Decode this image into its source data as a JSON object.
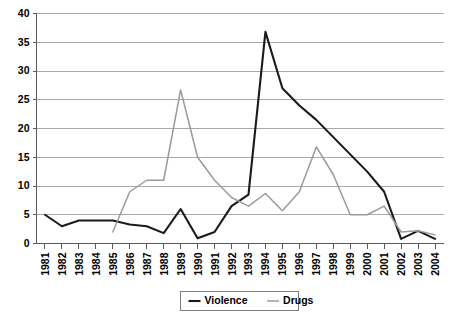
{
  "chart_data": {
    "type": "line",
    "title": "",
    "xlabel": "",
    "ylabel": "",
    "ylim": [
      0,
      40
    ],
    "ytick_step": 5,
    "grid": true,
    "legend_position": "bottom-center",
    "yticks": [
      "0",
      "5",
      "10",
      "15",
      "20",
      "25",
      "30",
      "35",
      "40"
    ],
    "categories": [
      "1981",
      "1982",
      "1983",
      "1984",
      "1985",
      "1986",
      "1987",
      "1988",
      "1989",
      "1990",
      "1991",
      "1992",
      "1993",
      "1994",
      "1995",
      "1996",
      "1997",
      "1998",
      "1999",
      "2000",
      "2001",
      "2002",
      "2003",
      "2004"
    ],
    "series": [
      {
        "name": "Violence",
        "color": "#1a1a1a",
        "values": [
          5,
          3,
          4,
          4,
          4,
          3.3,
          3,
          1.8,
          6,
          0.9,
          2,
          6.5,
          8.5,
          36.8,
          27,
          24,
          21.5,
          18.5,
          15.5,
          12.5,
          9,
          0.8,
          2.2,
          0.8
        ]
      },
      {
        "name": "Drugs",
        "color": "#9a9a9a",
        "values": [
          null,
          null,
          null,
          null,
          2,
          9,
          11,
          11,
          26.7,
          15,
          11,
          8,
          6.5,
          8.7,
          5.7,
          9,
          16.8,
          12,
          5,
          5,
          6.5,
          2,
          2.2,
          1.5
        ]
      }
    ]
  },
  "legend": {
    "items": [
      {
        "label": "Violence",
        "key": "violence"
      },
      {
        "label": "Drugs",
        "key": "drugs"
      }
    ]
  }
}
